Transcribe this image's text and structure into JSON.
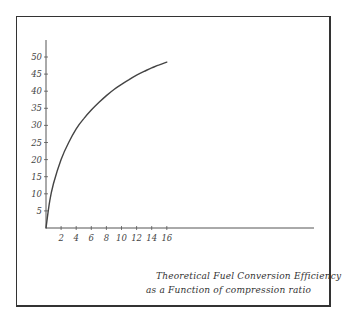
{
  "chart_data": {
    "type": "line",
    "title": "Theoretical Fuel Conversion Efficiency as a Function of compression ratio",
    "caption_lines": [
      "Theoretical Fuel Conversion Efficiency",
      "as a Function of compression ratio"
    ],
    "xlabel": "",
    "ylabel": "",
    "xlim": [
      0,
      17
    ],
    "ylim": [
      0,
      53
    ],
    "x_ticks": [
      2,
      4,
      6,
      8,
      10,
      12,
      14,
      16
    ],
    "x_tick_labels": [
      "2",
      "4",
      "6",
      "8",
      "10",
      "12",
      "14",
      "16"
    ],
    "y_ticks": [
      5,
      10,
      15,
      20,
      25,
      30,
      35,
      40,
      45,
      50
    ],
    "y_tick_labels": [
      "5",
      "10",
      "15",
      "20",
      "25",
      "30",
      "35",
      "40",
      "45",
      "50"
    ],
    "grid": false,
    "legend": null,
    "series": [
      {
        "name": "Efficiency",
        "x": [
          0,
          0.5,
          1,
          2,
          3,
          4,
          5,
          6,
          7,
          8,
          9,
          10,
          11,
          12,
          13,
          14,
          15,
          16
        ],
        "values": [
          0,
          8,
          13,
          20,
          25,
          29,
          32,
          34.5,
          36.7,
          38.7,
          40.5,
          42,
          43.4,
          44.7,
          45.8,
          46.8,
          47.7,
          48.5
        ]
      }
    ],
    "colors": {
      "line": "#444444",
      "axis": "#555555",
      "frame": "#333333"
    }
  }
}
